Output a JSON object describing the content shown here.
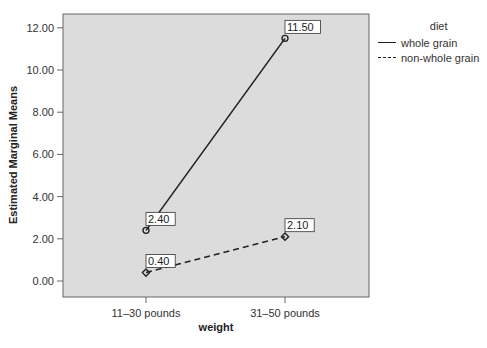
{
  "chart_data": {
    "type": "line",
    "title": "",
    "xlabel": "weight",
    "ylabel": "Estimated Marginal Means",
    "categories": [
      "11–30 pounds",
      "31–50 pounds"
    ],
    "ylim": [
      -0.6,
      13.3
    ],
    "yticks": [
      "0.00",
      "2.00",
      "4.00",
      "6.00",
      "8.00",
      "10.00",
      "12.00"
    ],
    "grid": false,
    "legend_position": "right",
    "legend_title": "diet",
    "series": [
      {
        "name": "whole grain",
        "values": [
          2.4,
          11.5
        ],
        "labels": [
          "2.40",
          "11.50"
        ],
        "line_style": "solid",
        "marker": "circle"
      },
      {
        "name": "non-whole grain",
        "values": [
          0.4,
          2.1
        ],
        "labels": [
          "0.40",
          "2.10"
        ],
        "line_style": "dashed",
        "marker": "diamond"
      }
    ]
  },
  "colors": {
    "plot_background": "#dcdcdc",
    "line": "#222222",
    "frame": "#666666"
  }
}
